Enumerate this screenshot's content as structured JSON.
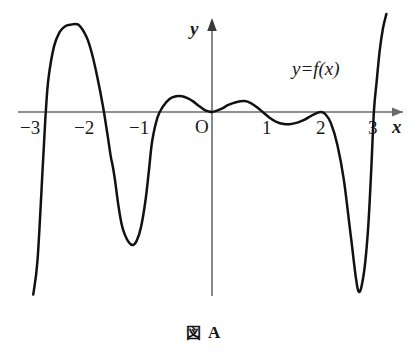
{
  "figure": {
    "caption_kanji": "図",
    "caption_letter": "A",
    "curve_label": "y=f(x)",
    "axis_label_x": "x",
    "axis_label_y": "y",
    "origin_label": "O",
    "curve_color": "#111111",
    "axis_color": "#6b6b6b",
    "background": "#ffffff"
  },
  "chart_data": {
    "type": "line",
    "xlabel": "x",
    "ylabel": "y",
    "series_name": "y=f(x)",
    "grid": false,
    "legend_position": "upper-right-inline",
    "xlim": [
      -3.45,
      3.85
    ],
    "ylim": [
      -3.4,
      1.75
    ],
    "xticks": [
      -3,
      -2,
      -1,
      0,
      1,
      2,
      3
    ],
    "xtick_labels": [
      "−3",
      "−2",
      "−1",
      "O",
      "1",
      "2",
      "3"
    ],
    "yticks": [],
    "ytick_labels": [],
    "roots": [
      {
        "x": -3.05,
        "multiplicity": 1
      },
      {
        "x": -1.82,
        "multiplicity": 1
      },
      {
        "x": -1.1,
        "multiplicity": 1
      },
      {
        "x": 0.0,
        "multiplicity": 2
      },
      {
        "x": 0.93,
        "multiplicity": 1
      },
      {
        "x": 2.0,
        "multiplicity": 2
      },
      {
        "x": 2.97,
        "multiplicity": 1
      }
    ],
    "extrema": [
      {
        "x": -2.45,
        "y": 1.6,
        "kind": "local-max"
      },
      {
        "x": -1.45,
        "y": -2.44,
        "kind": "local-min"
      },
      {
        "x": -0.55,
        "y": 0.29,
        "kind": "local-max"
      },
      {
        "x": 0.0,
        "y": 0.0,
        "kind": "local-min"
      },
      {
        "x": 0.6,
        "y": 0.2,
        "kind": "local-max"
      },
      {
        "x": 1.45,
        "y": -0.22,
        "kind": "local-min"
      },
      {
        "x": 2.0,
        "y": 0.0,
        "kind": "local-max"
      },
      {
        "x": 2.68,
        "y": -3.27,
        "kind": "local-min"
      }
    ],
    "x": [
      -3.28,
      -3.2,
      -3.1,
      -3.05,
      -3.0,
      -2.9,
      -2.8,
      -2.7,
      -2.6,
      -2.45,
      -2.3,
      -2.2,
      -2.1,
      -2.0,
      -1.92,
      -1.86,
      -1.82,
      -1.78,
      -1.72,
      -1.66,
      -1.6,
      -1.52,
      -1.45,
      -1.38,
      -1.3,
      -1.22,
      -1.16,
      -1.1,
      -1.0,
      -0.9,
      -0.78,
      -0.66,
      -0.55,
      -0.44,
      -0.34,
      -0.24,
      -0.14,
      -0.06,
      0.0,
      0.08,
      0.18,
      0.3,
      0.44,
      0.6,
      0.72,
      0.82,
      0.93,
      1.05,
      1.18,
      1.32,
      1.45,
      1.58,
      1.7,
      1.82,
      1.92,
      2.0,
      2.08,
      2.18,
      2.3,
      2.42,
      2.55,
      2.68,
      2.78,
      2.86,
      2.92,
      2.97,
      3.02,
      3.08,
      3.14,
      3.2
    ],
    "y": [
      -3.35,
      -2.7,
      -0.9,
      0.0,
      0.62,
      1.2,
      1.46,
      1.57,
      1.6,
      1.6,
      1.37,
      1.06,
      0.62,
      0.1,
      -0.4,
      -0.8,
      -1.0,
      -1.25,
      -1.7,
      -2.05,
      -2.25,
      -2.4,
      -2.44,
      -2.36,
      -2.1,
      -1.62,
      -1.1,
      -0.55,
      -0.1,
      0.1,
      0.24,
      0.29,
      0.29,
      0.25,
      0.19,
      0.11,
      0.04,
      0.01,
      0.0,
      0.02,
      0.06,
      0.13,
      0.18,
      0.2,
      0.16,
      0.09,
      0.0,
      -0.1,
      -0.18,
      -0.22,
      -0.22,
      -0.19,
      -0.14,
      -0.07,
      -0.02,
      0.0,
      -0.04,
      -0.2,
      -0.6,
      -1.25,
      -2.3,
      -3.27,
      -3.0,
      -2.2,
      -1.1,
      0.0,
      0.55,
      1.15,
      1.55,
      1.8
    ]
  }
}
